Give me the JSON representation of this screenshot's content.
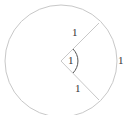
{
  "diagram": {
    "type": "circle-sector-radian",
    "labels": {
      "upper_radius": "1",
      "angle": "1",
      "arc_length": "1",
      "lower_radius": "1"
    },
    "colors": {
      "circle": "#c8c8c8",
      "radius": "#c8c8c8",
      "angle_arc": "#555555",
      "text": "#333333"
    }
  }
}
